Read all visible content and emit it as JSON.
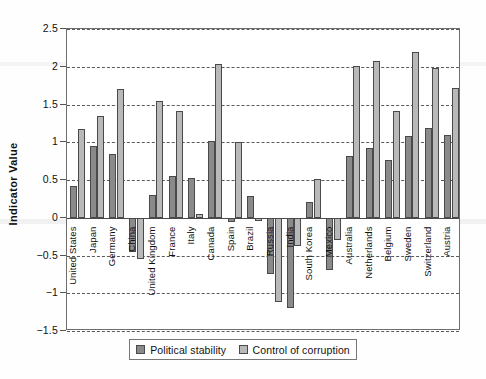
{
  "chart_data": {
    "type": "bar",
    "title": "",
    "xlabel": "",
    "ylabel": "Indicator Value",
    "ylim": [
      -1.5,
      2.5
    ],
    "ytick_labels": [
      "2.5",
      "2",
      "1.5",
      "1",
      "0.5",
      "0",
      "-0.5",
      "-1",
      "-1.5"
    ],
    "ytick_values": [
      2.5,
      2,
      1.5,
      1,
      0.5,
      0,
      -0.5,
      -1,
      -1.5
    ],
    "grid": true,
    "grid_style": "dashed-horizontal",
    "legend_position": "bottom",
    "categories": [
      "United States",
      "Japan",
      "Germany",
      "China",
      "United Kingdom",
      "France",
      "Italy",
      "Canada",
      "Spain",
      "Brazil",
      "Russia",
      "India",
      "South Korea",
      "Mexico",
      "Australia",
      "Netherlands",
      "Belgium",
      "Sweden",
      "Switzerland",
      "Austria"
    ],
    "series": [
      {
        "name": "Political stability",
        "color": "#8a8a8a",
        "values": [
          0.42,
          0.95,
          0.85,
          -0.46,
          0.3,
          0.55,
          0.53,
          1.01,
          -0.05,
          0.29,
          -0.74,
          -1.2,
          0.21,
          -0.69,
          0.82,
          0.93,
          0.77,
          1.08,
          1.19,
          1.1
        ]
      },
      {
        "name": "Control of corruption",
        "color": "#b9b9b9",
        "values": [
          1.18,
          1.35,
          1.7,
          -0.54,
          1.54,
          1.41,
          0.05,
          2.03,
          1.0,
          -0.04,
          -1.12,
          -0.38,
          0.51,
          -0.3,
          2.01,
          2.08,
          1.42,
          2.2,
          1.99,
          1.72
        ]
      }
    ]
  },
  "legend": {
    "items": [
      {
        "label": "Political stability",
        "swatch": "series-1-swatch"
      },
      {
        "label": "Control of corruption",
        "swatch": "series-2-swatch"
      }
    ]
  }
}
